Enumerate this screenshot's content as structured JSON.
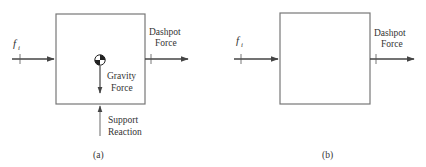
{
  "figure": {
    "panels": [
      {
        "id": "a",
        "caption": "(a)",
        "input_force": {
          "symbol": "f",
          "subscript": "i"
        },
        "dashpot_force": {
          "line1": "Dashpot",
          "line2": "Force"
        },
        "gravity_force": {
          "line1": "Gravity",
          "line2": "Force"
        },
        "support_reaction": {
          "line1": "Support",
          "line2": "Reaction"
        },
        "center_of_mass_icon": "center-of-mass-symbol"
      },
      {
        "id": "b",
        "caption": "(b)",
        "input_force": {
          "symbol": "f",
          "subscript": "i"
        },
        "dashpot_force": {
          "line1": "Dashpot",
          "line2": "Force"
        }
      }
    ],
    "colors": {
      "line": "#555555",
      "text": "#333333",
      "background": "#ffffff"
    }
  }
}
